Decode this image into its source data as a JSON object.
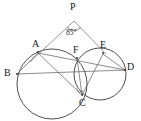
{
  "figure": {
    "type": "euclidean-geometry-diagram",
    "width": 141,
    "height": 121,
    "background_color": "#ffffff",
    "stroke_color": "#3a3a3a",
    "label_color": "#1a1a1a"
  },
  "labels": {
    "p": "P",
    "a": "A",
    "b": "B",
    "c": "C",
    "d": "D",
    "e": "E",
    "f": "F",
    "angle_p": "85°"
  },
  "points": [
    {
      "id": "P",
      "label": "P",
      "x": 74,
      "y": 17
    },
    {
      "id": "A",
      "label": "A",
      "x": 38,
      "y": 51
    },
    {
      "id": "B",
      "label": "B",
      "x": 16,
      "y": 74
    },
    {
      "id": "C",
      "label": "C",
      "x": 82,
      "y": 97
    },
    {
      "id": "D",
      "label": "D",
      "x": 127,
      "y": 70
    },
    {
      "id": "E",
      "label": "E",
      "x": 103,
      "y": 51
    },
    {
      "id": "F",
      "label": "F",
      "x": 77,
      "y": 57
    }
  ],
  "circles": [
    {
      "id": "big-circle",
      "cx": 52,
      "cy": 84,
      "r": 35
    },
    {
      "id": "small-circle",
      "cx": 100,
      "cy": 74,
      "r": 26
    }
  ],
  "segments": [
    {
      "id": "PA",
      "from": "P",
      "to": "A"
    },
    {
      "id": "PE",
      "from": "P",
      "to": "E"
    },
    {
      "id": "AB",
      "from": "A",
      "to": "B"
    },
    {
      "id": "AC",
      "from": "A",
      "to": "C"
    },
    {
      "id": "AD",
      "from": "A",
      "to": "D"
    },
    {
      "id": "BD",
      "from": "B",
      "to": "D"
    },
    {
      "id": "FC",
      "from": "F",
      "to": "C"
    },
    {
      "id": "EC",
      "from": "E",
      "to": "C"
    },
    {
      "id": "ED",
      "from": "E",
      "to": "D"
    }
  ],
  "annotations": {
    "angle_at_p": {
      "value": "85°",
      "vertex": "P",
      "label_x": 68,
      "label_y": 27
    },
    "right_angle_at_c": {
      "vertex": "C",
      "marked": true
    }
  }
}
